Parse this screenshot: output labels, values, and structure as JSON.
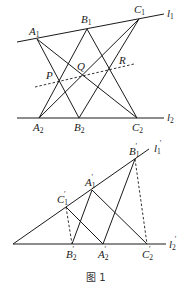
{
  "figure": {
    "caption": "图 1",
    "top": {
      "lines": {
        "l1": "l",
        "l1_sub": "1",
        "l2": "l",
        "l2_sub": "2"
      },
      "points": {
        "A1": {
          "main": "A",
          "sub": "1"
        },
        "B1": {
          "main": "B",
          "sub": "1"
        },
        "C1": {
          "main": "C",
          "sub": "1"
        },
        "A2": {
          "main": "A",
          "sub": "2"
        },
        "B2": {
          "main": "B",
          "sub": "2"
        },
        "C2": {
          "main": "C",
          "sub": "2"
        },
        "P": {
          "main": "P"
        },
        "Q": {
          "main": "Q"
        },
        "R": {
          "main": "R"
        }
      }
    },
    "bottom": {
      "lines": {
        "l1p": "l",
        "l1p_sub": "1",
        "l2p": "l",
        "l2p_sub": "2",
        "prime": "′"
      },
      "points": {
        "A1p": {
          "main": "A",
          "sub": "1",
          "prime": "′"
        },
        "B1p": {
          "main": "B",
          "sub": "1",
          "prime": "′"
        },
        "C1p": {
          "main": "C",
          "sub": "1",
          "prime": "′"
        },
        "A2p": {
          "main": "A",
          "sub": "2",
          "prime": "′"
        },
        "B2p": {
          "main": "B",
          "sub": "2",
          "prime": "′"
        },
        "C2p": {
          "main": "C",
          "sub": "2",
          "prime": "′"
        }
      }
    }
  }
}
